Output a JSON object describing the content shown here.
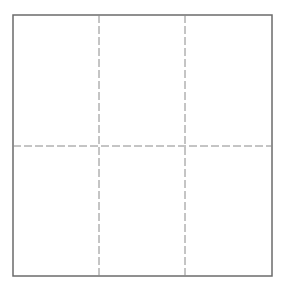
{
  "diagram": {
    "type": "grid",
    "rows": 2,
    "columns": 3,
    "outer_border": {
      "x": 13,
      "y": 15,
      "width": 259,
      "height": 261,
      "color": "#6b6b6b",
      "style": "solid"
    },
    "divider_color": "#8a8a8a",
    "divider_style": "dashed",
    "vertical_dividers_x": [
      99,
      185
    ],
    "horizontal_dividers_y": [
      146
    ]
  }
}
